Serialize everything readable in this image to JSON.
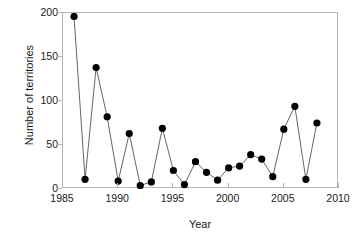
{
  "chart_data": {
    "type": "line",
    "title": "",
    "xlabel": "Year",
    "ylabel": "Number of territories",
    "xlim": [
      1985,
      2010
    ],
    "ylim": [
      0,
      200
    ],
    "xticks": [
      1985,
      1990,
      1995,
      2000,
      2005,
      2010
    ],
    "yticks": [
      0,
      50,
      100,
      150,
      200
    ],
    "grid": false,
    "legend": null,
    "marker": "filled-circle",
    "marker_color": "#000000",
    "line_color": "#555555",
    "x": [
      1986,
      1987,
      1988,
      1989,
      1990,
      1991,
      1992,
      1993,
      1994,
      1995,
      1996,
      1997,
      1998,
      1999,
      2000,
      2001,
      2002,
      2003,
      2004,
      2005,
      2006,
      2007,
      2008
    ],
    "values": [
      196,
      11,
      138,
      82,
      9,
      63,
      4,
      8,
      69,
      21,
      5,
      31,
      19,
      10,
      24,
      26,
      39,
      34,
      14,
      68,
      94,
      11,
      75
    ],
    "series": [
      {
        "name": "Number of territories",
        "values": [
          196,
          11,
          138,
          82,
          9,
          63,
          4,
          8,
          69,
          21,
          5,
          31,
          19,
          10,
          24,
          26,
          39,
          34,
          14,
          68,
          94,
          11,
          75
        ]
      }
    ]
  },
  "axis": {
    "ylabel_text": "Number of territories",
    "xlabel_text": "Year",
    "xtick_labels": [
      "1985",
      "1990",
      "1995",
      "2000",
      "2005",
      "2010"
    ],
    "ytick_labels": [
      "0",
      "50",
      "100",
      "150",
      "200"
    ]
  }
}
